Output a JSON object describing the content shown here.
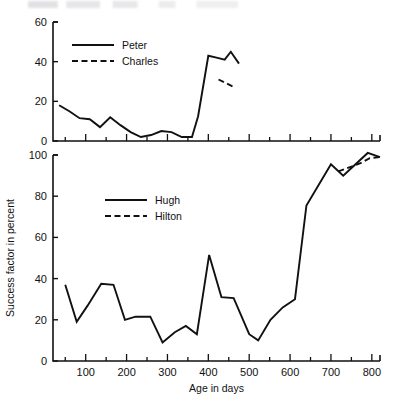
{
  "chart_data": {
    "type": "line",
    "title": "",
    "xlabel": "Age in days",
    "ylabel": "Success factor in percent",
    "layout": "two stacked panels sharing a common x-axis",
    "grid": false,
    "xlim": [
      20,
      820
    ],
    "x_ticks_major": [
      100,
      200,
      300,
      400,
      500,
      600,
      700,
      800
    ],
    "x_ticks_minor_step": 50,
    "panels": [
      {
        "name": "upper-panel",
        "ylim": [
          0,
          60
        ],
        "y_ticks": [
          0,
          20,
          40,
          60
        ],
        "legend_position": "upper left",
        "series": [
          {
            "name": "Peter",
            "style": "solid",
            "color": "#111111",
            "points": [
              [
                35,
                18
              ],
              [
                60,
                15
              ],
              [
                85,
                11.5
              ],
              [
                110,
                11
              ],
              [
                135,
                7
              ],
              [
                160,
                12
              ],
              [
                185,
                8
              ],
              [
                210,
                4.5
              ],
              [
                235,
                2
              ],
              [
                260,
                3
              ],
              [
                285,
                5
              ],
              [
                310,
                4.5
              ],
              [
                335,
                2
              ],
              [
                360,
                2
              ],
              [
                375,
                12.5
              ],
              [
                400,
                43
              ],
              [
                420,
                42
              ],
              [
                440,
                41
              ],
              [
                455,
                45
              ],
              [
                475,
                39
              ]
            ]
          },
          {
            "name": "Charles",
            "style": "dashed",
            "color": "#111111",
            "points": [
              [
                425,
                31
              ],
              [
                465,
                27
              ]
            ]
          }
        ]
      },
      {
        "name": "lower-panel",
        "ylim": [
          0,
          100
        ],
        "y_ticks": [
          0,
          20,
          40,
          60,
          80,
          100
        ],
        "legend_position": "upper left",
        "series": [
          {
            "name": "Hugh",
            "style": "solid",
            "color": "#111111",
            "points": [
              [
                50,
                37
              ],
              [
                78,
                19
              ],
              [
                105,
                27
              ],
              [
                138,
                37.5
              ],
              [
                168,
                37
              ],
              [
                196,
                20
              ],
              [
                222,
                21.5
              ],
              [
                258,
                21.5
              ],
              [
                288,
                9
              ],
              [
                318,
                14
              ],
              [
                345,
                17
              ],
              [
                372,
                13
              ],
              [
                402,
                51.5
              ],
              [
                432,
                31
              ],
              [
                462,
                30.5
              ],
              [
                500,
                13
              ],
              [
                522,
                10
              ],
              [
                552,
                20
              ],
              [
                582,
                26
              ],
              [
                612,
                30
              ],
              [
                640,
                75.5
              ],
              [
                700,
                95.5
              ],
              [
                730,
                90
              ],
              [
                790,
                101
              ],
              [
                820,
                99
              ]
            ]
          },
          {
            "name": "Hilton",
            "style": "dashed",
            "color": "#111111",
            "points": [
              [
                718,
                92
              ],
              [
                745,
                94
              ],
              [
                772,
                96
              ],
              [
                795,
                98.5
              ],
              [
                820,
                99
              ]
            ]
          }
        ]
      }
    ]
  },
  "legends": {
    "upper": [
      {
        "label": "Peter",
        "style": "solid"
      },
      {
        "label": "Charles",
        "style": "dashed"
      }
    ],
    "lower": [
      {
        "label": "Hugh",
        "style": "solid"
      },
      {
        "label": "Hilton",
        "style": "dashed"
      }
    ]
  },
  "axis_labels": {
    "x": "Age in days",
    "y": "Success factor in percent",
    "upper_y_ticks": [
      "0",
      "20",
      "40",
      "60"
    ],
    "lower_y_ticks": [
      "0",
      "20",
      "40",
      "60",
      "80",
      "100"
    ],
    "x_ticks": [
      "100",
      "200",
      "300",
      "400",
      "500",
      "600",
      "700",
      "800"
    ]
  }
}
